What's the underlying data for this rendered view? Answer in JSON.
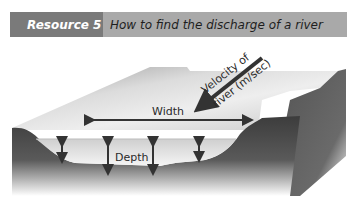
{
  "header": {
    "tag": "Resource 5",
    "title": "How to find the discharge of a river"
  },
  "diagram": {
    "labels": {
      "velocity_line1": "Velocity of",
      "velocity_line2": "river (m/sec)",
      "width": "Width",
      "depth": "Depth"
    },
    "depth_arrow_count": 4,
    "colors": {
      "tag_bg": "#7a7a7a",
      "title_bg": "#a9a9a9",
      "ground": "#4a4a4a",
      "water": "#e6e6e6",
      "arrow": "#333333"
    }
  }
}
